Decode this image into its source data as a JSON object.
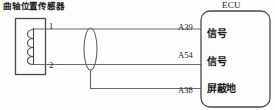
{
  "diagram": {
    "type": "automotive-wiring-schematic",
    "sensor": {
      "title": "曲轴位置传感器",
      "symbol": "inductive-coil",
      "terminals": [
        {
          "number": "1",
          "position": "top"
        },
        {
          "number": "2",
          "position": "bottom"
        }
      ]
    },
    "shield": {
      "symbol": "shield-oval",
      "drop_wire": true
    },
    "ecu": {
      "title": "ECU",
      "pins": [
        {
          "id": "A39",
          "function": "信号"
        },
        {
          "id": "A54",
          "function": "信号"
        },
        {
          "id": "A38",
          "function": "屏蔽地"
        }
      ]
    },
    "wires": [
      {
        "from": "1",
        "to": "A39"
      },
      {
        "from": "2",
        "to": "A54"
      },
      {
        "from": "shield",
        "to": "A38"
      }
    ],
    "colors": {
      "line": "#6b6b6b",
      "box_stroke": "#4a4a4a",
      "text": "#1a1a1a",
      "background": "#fdfdfd"
    }
  }
}
